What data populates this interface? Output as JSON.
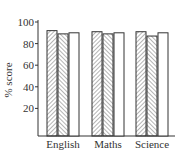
{
  "chart_data": {
    "type": "bar",
    "title": "",
    "xlabel": "",
    "ylabel": "% score",
    "ylim": [
      0,
      100
    ],
    "yticks": [
      20,
      40,
      60,
      80,
      100
    ],
    "grid": false,
    "legend": null,
    "categories": [
      "English",
      "Maths",
      "Science"
    ],
    "series": [
      {
        "name": "Series 1",
        "pattern": "hatch-forward",
        "values": [
          92,
          91,
          91
        ]
      },
      {
        "name": "Series 2",
        "pattern": "hatch-backward",
        "values": [
          89,
          89,
          87
        ]
      },
      {
        "name": "Series 3",
        "pattern": "plain",
        "values": [
          90,
          90,
          90
        ]
      }
    ]
  },
  "colors": {
    "stroke": "#333333",
    "fill": "#ffffff",
    "text": "#333333"
  }
}
